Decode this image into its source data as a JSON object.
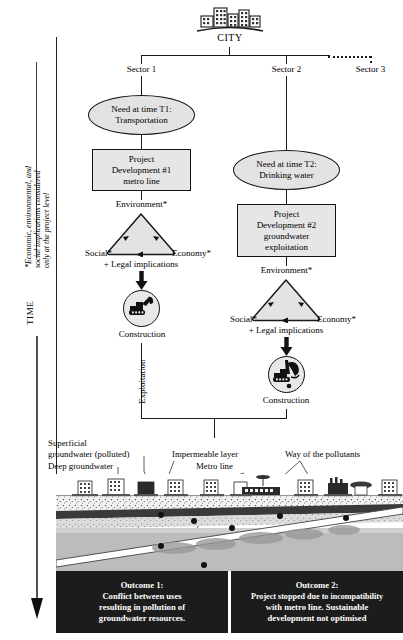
{
  "diagram": {
    "title_node": {
      "label": "CITY",
      "icon": "city-buildings-icon"
    },
    "sectors": [
      {
        "label": "Sector 1"
      },
      {
        "label": "Sector 2"
      },
      {
        "label": "Sector 3"
      }
    ],
    "branch1": {
      "need": "Need at time T1:\nTransportation",
      "need_line1": "Need at time T1:",
      "need_line2": "Transportation",
      "project_line1": "Project",
      "project_line2": "Development #1",
      "project_line3": "metro line",
      "triangle": {
        "top": "Environment*",
        "left": "Social*",
        "right": "Economy*",
        "footnote": "+ Legal implications"
      },
      "construction": "Construction",
      "construction_icon": "excavator-icon",
      "flow_label": "Exploitation"
    },
    "branch2": {
      "need_line1": "Need at time T2:",
      "need_line2": "Drinking water",
      "project_line1": "Project",
      "project_line2": "Development #2",
      "project_line3": "groundwater",
      "project_line4": "exploitation",
      "triangle": {
        "top": "Environment*",
        "left": "Social*",
        "right": "Economy*",
        "footnote": "+ Legal implications"
      },
      "construction": "Construction",
      "construction_icon": "drilling-rig-icon"
    },
    "axis": {
      "time_label": "TIME",
      "footnote_line1": "*Economic, environmental, and",
      "footnote_line2": "social implications considered",
      "footnote_line3": "only at the project level"
    },
    "cross_section": {
      "callouts": [
        {
          "name": "superficial-groundwater",
          "line1": "Superficial",
          "line2": "groundwater (polluted)"
        },
        {
          "name": "deep-groundwater",
          "line1": "Deep groundwater"
        },
        {
          "name": "impermeable-layer",
          "line1": "Impermeable layer"
        },
        {
          "name": "metro-line",
          "line1": "Metro line"
        },
        {
          "name": "way-of-pollutants",
          "line1": "Way of the pollutants"
        }
      ]
    },
    "outcomes": [
      {
        "heading": "Outcome 1:",
        "line1": "Conflict between uses",
        "line2": "resulting in pollution of",
        "line3": "groundwater resources."
      },
      {
        "heading": "Outcome 2:",
        "line1": "Project stopped due to incompatibility",
        "line2": "with metro line. Sustainable",
        "line3": "development not optimised"
      }
    ],
    "colors": {
      "ink": "#111111",
      "node_fill": "#e5e5e5",
      "outcome_bg": "#1c1c1c",
      "outcome_fg": "#ffffff",
      "impermeable": "#3a3a3a",
      "deep_water": "#b6b6b6"
    }
  }
}
